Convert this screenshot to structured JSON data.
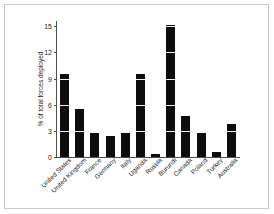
{
  "chart_data": {
    "type": "bar",
    "title": "",
    "xlabel": "",
    "ylabel": "% of total forces deployed",
    "ylim": [
      0,
      15.6
    ],
    "yticks": [
      0,
      3,
      6,
      9,
      12,
      15
    ],
    "grid": true,
    "legend": null,
    "bar_color": "#0d0d0d",
    "categories": [
      "United States",
      "United Kingdom",
      "France",
      "Germany",
      "Italy",
      "Uganda",
      "Russia",
      "Burundi",
      "Canada",
      "Poland",
      "Turkey",
      "Australia"
    ],
    "values": [
      9.5,
      5.5,
      2.8,
      2.4,
      2.7,
      9.5,
      0.4,
      15.1,
      4.7,
      2.8,
      0.6,
      3.8
    ]
  }
}
